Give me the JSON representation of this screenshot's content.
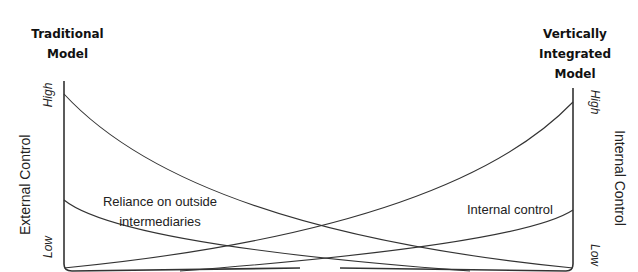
{
  "left_model": {
    "title_line1": "Traditional",
    "title_line2": "Model"
  },
  "right_model": {
    "title_line1": "Vertically",
    "title_line2": "Integrated",
    "title_line3": "Model"
  },
  "left_axis": {
    "label": "External Control",
    "high": "High",
    "low": "Low"
  },
  "right_axis": {
    "label": "Internal Control",
    "high": "High",
    "low": "Low"
  },
  "curves": {
    "reliance_label_line1": "Reliance on outside",
    "reliance_label_line2": "intermediaries",
    "internal_label": "Internal control"
  },
  "colors": {
    "line": "#333333",
    "background": "#ffffff"
  }
}
